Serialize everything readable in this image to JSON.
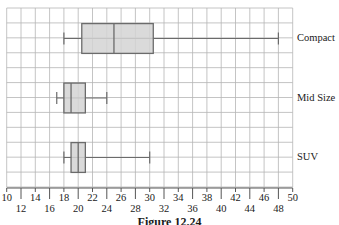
{
  "chart_data": {
    "type": "boxplot",
    "orientation": "horizontal",
    "title": "",
    "caption": "Figure 12.24",
    "xlabel": "",
    "ylabel": "",
    "xlim": [
      10,
      50
    ],
    "x_ticks": [
      10,
      12,
      14,
      16,
      18,
      20,
      22,
      24,
      26,
      28,
      30,
      32,
      34,
      36,
      38,
      40,
      42,
      44,
      46,
      48,
      50
    ],
    "grid": true,
    "categories": [
      "Compact",
      "Mid Size",
      "SUV"
    ],
    "series": [
      {
        "name": "Compact",
        "min": 18,
        "q1": 20.5,
        "median": 25,
        "q3": 30.5,
        "max": 48
      },
      {
        "name": "Mid Size",
        "min": 17,
        "q1": 18,
        "median": 19,
        "q3": 21,
        "max": 24
      },
      {
        "name": "SUV",
        "min": 18,
        "q1": 19,
        "median": 20,
        "q3": 21,
        "max": 30
      }
    ],
    "colors": {
      "box_fill": "#d4d4d4",
      "box_stroke": "#6b6b6b",
      "grid": "#b5b5b5",
      "axis": "#555555"
    }
  },
  "labels": {
    "compact": "Compact",
    "mid_size": "Mid Size",
    "suv": "SUV",
    "caption": "Figure 12.24"
  }
}
